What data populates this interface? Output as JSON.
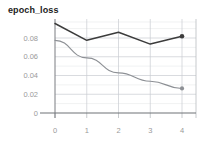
{
  "chart_data": {
    "type": "line",
    "title": "epoch_loss",
    "xlabel": "",
    "ylabel": "",
    "x": [
      0,
      1,
      2,
      3,
      4
    ],
    "xtick_labels": [
      "0",
      "1",
      "2",
      "3",
      "4"
    ],
    "ytick_labels": [
      "0.08",
      "0.06",
      "0.04",
      "0.02",
      "0"
    ],
    "ytick_values": [
      0.08,
      0.06,
      0.04,
      0.02,
      0
    ],
    "xlim": [
      -0.45,
      4.45
    ],
    "ylim": [
      0,
      0.1
    ],
    "grid": true,
    "grid_minor": true,
    "legend": "none",
    "series": [
      {
        "name": "epoch_loss",
        "color": "#3c3c3c",
        "marker_end": true,
        "values": [
          0.0955,
          0.0775,
          0.0862,
          0.0735,
          0.0818
        ]
      },
      {
        "name": "epoch_loss_smoothed",
        "color": "#8d9095",
        "marker_end": true,
        "values": [
          0.0775,
          0.0588,
          0.0428,
          0.0338,
          0.0262
        ]
      }
    ]
  },
  "geometry": {
    "plot_left": 55,
    "plot_right": 196,
    "x_step": 31.75,
    "y_zero_px": 113,
    "px_per_unit": 937.5,
    "y_top_px": 19,
    "ytick_px": [
      38.0,
      56.75,
      75.5,
      94.25,
      113.0
    ],
    "yminor_px": [
      28.6,
      47.4,
      66.1,
      84.9,
      103.6,
      22.0
    ],
    "xtick_px": [
      55,
      86.75,
      118.5,
      150.25,
      182
    ],
    "xlabel_y": 133,
    "tick_top": 113,
    "tick_bottom": 118
  }
}
